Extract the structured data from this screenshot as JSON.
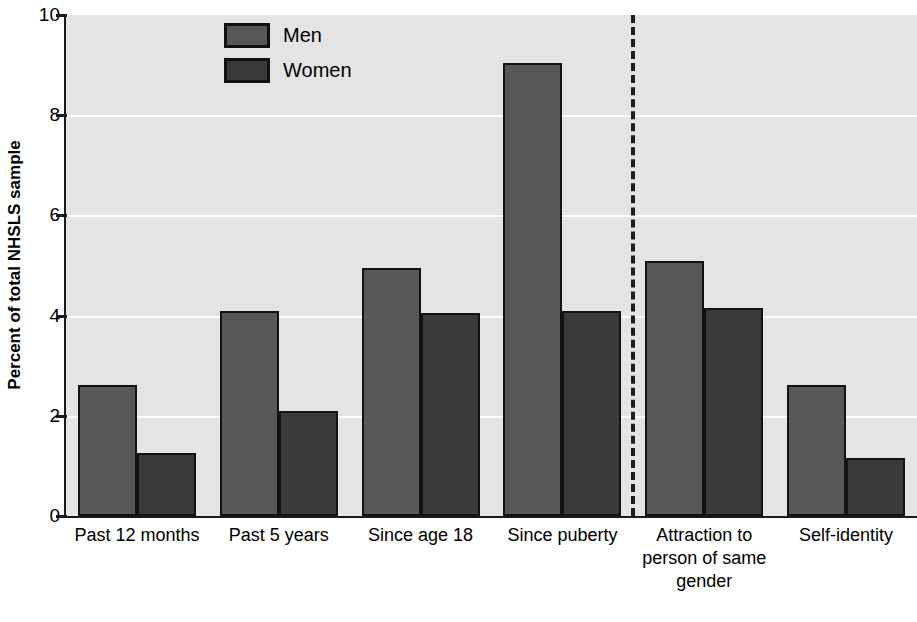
{
  "chart_data": {
    "type": "bar",
    "title": "",
    "xlabel": "",
    "ylabel": "Percent of total NHSLS sample",
    "ylim": [
      0,
      10
    ],
    "ytick_labels": [
      "0",
      "2",
      "4",
      "6",
      "8",
      "10"
    ],
    "yticks": [
      0,
      2,
      4,
      6,
      8,
      10
    ],
    "grid": true,
    "gridlines_at": [
      2,
      4,
      6,
      8
    ],
    "legend_position": "top-left-inside",
    "categories": [
      "Past 12 months",
      "Past 5 years",
      "Since age 18",
      "Since puberty",
      "Attraction to person of same gender",
      "Self-identity"
    ],
    "category_label_lines": [
      [
        "Past 12 months"
      ],
      [
        "Past 5 years"
      ],
      [
        "Since age 18"
      ],
      [
        "Since puberty"
      ],
      [
        "Attraction to",
        "person of same",
        "gender"
      ],
      [
        "Self-identity"
      ]
    ],
    "series": [
      {
        "name": "Men",
        "color": "#585858",
        "values": [
          2.62,
          4.1,
          4.95,
          9.05,
          5.1,
          2.62
        ]
      },
      {
        "name": "Women",
        "color": "#3a3a3a",
        "values": [
          1.25,
          2.1,
          4.05,
          4.1,
          4.15,
          1.15
        ]
      }
    ],
    "annotations": [
      {
        "type": "vertical-dashed-divider",
        "after_category_index": 3
      }
    ],
    "colors": {
      "plot_background": "#e4e4e4",
      "gridline": "#fdfdfd",
      "axis": "#1a1a1a",
      "bar_border": "#121212",
      "men": "#585858",
      "women": "#3a3a3a"
    }
  },
  "legend": {
    "items": [
      {
        "label": "Men",
        "key": "men"
      },
      {
        "label": "Women",
        "key": "women"
      }
    ]
  }
}
